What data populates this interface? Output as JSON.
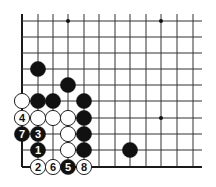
{
  "diagram": {
    "type": "go-board-corner",
    "grid": {
      "columns_x": [
        22,
        38,
        53,
        68,
        84,
        99,
        115,
        130,
        146,
        161,
        177,
        193
      ],
      "rows_y": [
        21,
        37,
        53,
        69,
        85,
        101,
        118,
        134,
        150,
        167
      ],
      "line_extend_top": 14,
      "line_extend_right": 202,
      "edges": [
        "left",
        "bottom"
      ],
      "line_color": "#333333",
      "edge_color": "#1a1a1a"
    },
    "star_points": [
      {
        "col": 3,
        "row": 0
      },
      {
        "col": 9,
        "row": 0
      },
      {
        "col": 9,
        "row": 6
      }
    ],
    "stones": [
      {
        "color": "black",
        "col": 1,
        "row": 3,
        "label": ""
      },
      {
        "color": "black",
        "col": 3,
        "row": 4,
        "label": ""
      },
      {
        "color": "white",
        "col": 0,
        "row": 5,
        "label": ""
      },
      {
        "color": "black",
        "col": 1,
        "row": 5,
        "label": ""
      },
      {
        "color": "black",
        "col": 2,
        "row": 5,
        "label": ""
      },
      {
        "color": "black",
        "col": 4,
        "row": 5,
        "label": ""
      },
      {
        "color": "white",
        "col": 0,
        "row": 6,
        "label": "4"
      },
      {
        "color": "white",
        "col": 1,
        "row": 6,
        "label": ""
      },
      {
        "color": "white",
        "col": 2,
        "row": 6,
        "label": ""
      },
      {
        "color": "white",
        "col": 3,
        "row": 6,
        "label": ""
      },
      {
        "color": "black",
        "col": 4,
        "row": 6,
        "label": ""
      },
      {
        "color": "black",
        "col": 0,
        "row": 7,
        "label": "7"
      },
      {
        "color": "black",
        "col": 1,
        "row": 7,
        "label": "3"
      },
      {
        "color": "white",
        "col": 3,
        "row": 7,
        "label": ""
      },
      {
        "color": "black",
        "col": 4,
        "row": 7,
        "label": ""
      },
      {
        "color": "black",
        "col": 1,
        "row": 8,
        "label": "1"
      },
      {
        "color": "white",
        "col": 3,
        "row": 8,
        "label": ""
      },
      {
        "color": "black",
        "col": 4,
        "row": 8,
        "label": ""
      },
      {
        "color": "black",
        "col": 7,
        "row": 8,
        "label": ""
      },
      {
        "color": "white",
        "col": 1,
        "row": 9,
        "label": "2"
      },
      {
        "color": "white",
        "col": 2,
        "row": 9,
        "label": "6"
      },
      {
        "color": "black",
        "col": 3,
        "row": 9,
        "label": "5"
      },
      {
        "color": "white",
        "col": 4,
        "row": 9,
        "label": "8"
      }
    ],
    "stone_radius": 7.6,
    "colors": {
      "black_stone": "#111111",
      "white_stone_fill": "#ffffff",
      "white_stone_stroke": "#222222",
      "label_on_black": "#ffffff",
      "label_on_white": "#111111"
    }
  }
}
